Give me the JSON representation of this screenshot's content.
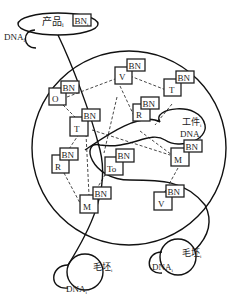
{
  "diagram": {
    "colors": {
      "stroke": "#111111",
      "background": "#ffffff"
    },
    "product": {
      "label": "产品",
      "sub": "i",
      "dna": "DNA",
      "dna_sub": "i",
      "bn": "BN",
      "bn_sub": "i"
    },
    "workpiece": {
      "label": "工件",
      "sub": "i",
      "dna": "DNA",
      "dna_sub": "i"
    },
    "blank_left": {
      "label": "毛坯",
      "sub": "i",
      "dna": "DNA",
      "dna_sub": "i"
    },
    "blank_right": {
      "label": "毛坯",
      "sub": "i",
      "dna": "DNA",
      "dna_sub": "i"
    },
    "nodes": [
      {
        "id": "O",
        "label": "O",
        "bn": "BN"
      },
      {
        "id": "V1",
        "label": "V",
        "bn": "BN"
      },
      {
        "id": "T1",
        "label": "T",
        "bn": "BN"
      },
      {
        "id": "R1",
        "label": "R",
        "bn": "BN"
      },
      {
        "id": "T2",
        "label": "T",
        "bn": "BN"
      },
      {
        "id": "R2",
        "label": "R",
        "bn": "BN"
      },
      {
        "id": "To",
        "label": "To",
        "bn": "BN"
      },
      {
        "id": "M1",
        "label": "M",
        "bn": "BN"
      },
      {
        "id": "M2",
        "label": "M",
        "bn": "BN"
      },
      {
        "id": "V2",
        "label": "V",
        "bn": "BN"
      }
    ]
  }
}
